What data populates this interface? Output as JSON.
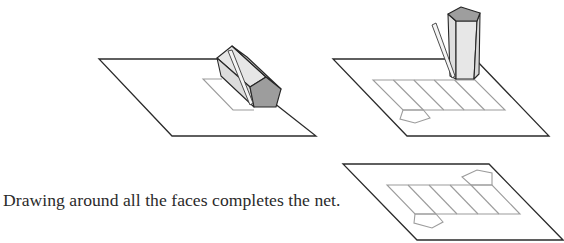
{
  "caption": {
    "text": "Drawing around all the faces completes the net."
  },
  "figures": [
    {
      "name": "step-trace-first-face",
      "description": "Pentagonal prism lying on paper, pencil tracing a rectangular face"
    },
    {
      "name": "step-roll-and-trace",
      "description": "Prism standing upright after rolling across; five rectangular faces and one pentagon traced"
    },
    {
      "name": "completed-net",
      "description": "Completed net: five rectangles in a row with a pentagon on each side"
    }
  ],
  "colors": {
    "paper_outline": "#2b2b2b",
    "net_lines": "#9c9c9c",
    "prism_face_light": "#e4e4e4",
    "prism_face_mid": "#d6d6d6",
    "prism_end_dark": "#9d9d9d"
  }
}
